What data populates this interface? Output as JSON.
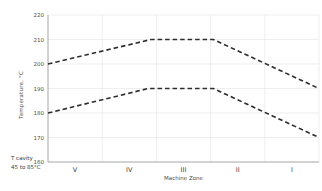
{
  "colors": {
    "background": "#ffffff",
    "grid": "#e7e7e7",
    "axis": "#a6a6a6",
    "text": "#4d4d4d",
    "line": "#2d2d2d"
  },
  "chart_data": {
    "type": "line",
    "title": "",
    "xlabel": "Machine Zone",
    "ylabel": "Temperature, °C",
    "categories": [
      "V",
      "IV",
      "III",
      "II",
      "I"
    ],
    "ylim": [
      160,
      220
    ],
    "yticks": [
      220,
      210,
      200,
      190,
      180,
      170,
      160
    ],
    "grid": true,
    "legend": "none",
    "line_style": "dashed",
    "x_units": "zone-bin coordinate 0..5 (0 = y-axis, 0.5 = center of zone V, 4.5 = center of zone I, 5 = right edge)",
    "series": [
      {
        "name": "upper-band",
        "color": "#2d2d2d",
        "style": "dashed",
        "points": [
          [
            0,
            200
          ],
          [
            1.9,
            210
          ],
          [
            3.05,
            210
          ],
          [
            5,
            190
          ]
        ]
      },
      {
        "name": "lower-band",
        "color": "#2d2d2d",
        "style": "dashed",
        "points": [
          [
            0,
            180
          ],
          [
            1.85,
            190
          ],
          [
            3.05,
            190
          ],
          [
            5,
            170
          ]
        ]
      }
    ],
    "annotation": {
      "line1": "T cavity",
      "line2": "45 to 85°C"
    }
  }
}
